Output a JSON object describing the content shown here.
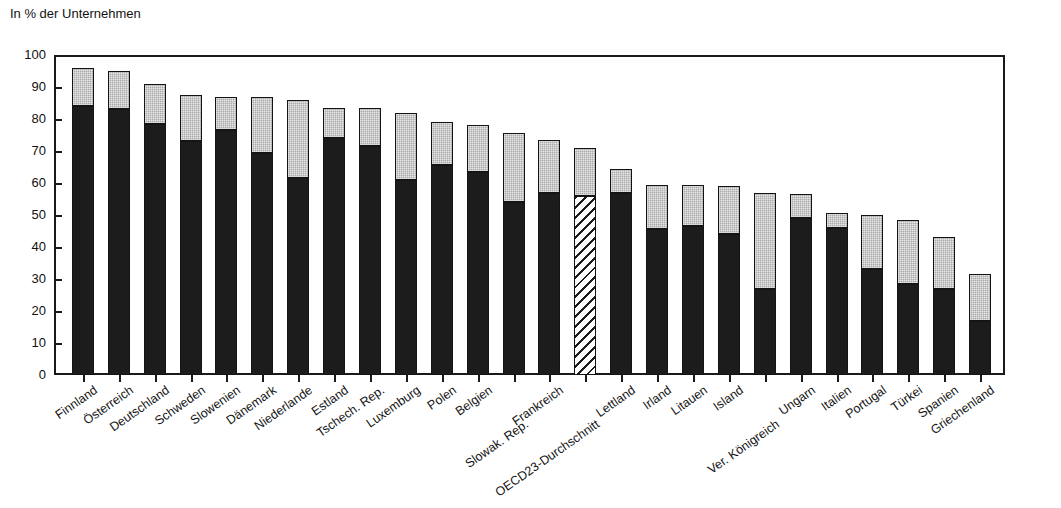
{
  "chart_data": {
    "type": "bar",
    "subtype": "stacked-bar",
    "title": "",
    "ylabel": "In % der Unternehmen",
    "xlabel": "",
    "ylim": [
      0,
      100
    ],
    "yticks": [
      0,
      10,
      20,
      30,
      40,
      50,
      60,
      70,
      80,
      90,
      100
    ],
    "grid": false,
    "legend_position": "none",
    "stacked": true,
    "categories": [
      "Finnland",
      "Österreich",
      "Deutschland",
      "Schweden",
      "Slowenien",
      "Dänemark",
      "Niederlande",
      "Estland",
      "Tschech. Rep.",
      "Luxemburg",
      "Polen",
      "Belgien",
      "Slowak. Rep.",
      "Frankreich",
      "OECD23-Durchschnitt",
      "Lettland",
      "Irland",
      "Litauen",
      "Island",
      "Ver. Königreich",
      "Ungarn",
      "Italien",
      "Portugal",
      "Türkei",
      "Spanien",
      "Griechenland"
    ],
    "series": [
      {
        "name": "lower-segment",
        "color": "#1c1c1c",
        "values": [
          84,
          83,
          78.5,
          73,
          76.5,
          69.5,
          61.5,
          74,
          71.5,
          61,
          65.5,
          63.5,
          54,
          57,
          56,
          57,
          45.5,
          46.5,
          44,
          27,
          49,
          46,
          33,
          28.5,
          27,
          17
        ]
      },
      {
        "name": "upper-segment",
        "color": "#a9a9a9",
        "values": [
          12,
          12,
          12.5,
          14.5,
          10.5,
          17.5,
          24.5,
          9.5,
          12,
          21,
          13.5,
          14.5,
          21.5,
          16.5,
          15,
          7.5,
          14,
          13,
          15,
          30,
          7.5,
          4.5,
          17,
          20,
          16,
          14.5
        ]
      }
    ],
    "totals": [
      96,
      95,
      91,
      87.5,
      87,
      87,
      86,
      83.5,
      83.5,
      82,
      79,
      78,
      75.5,
      73.5,
      71,
      64.5,
      59.5,
      59.5,
      59,
      57,
      56.5,
      50.5,
      50,
      48.5,
      43,
      31.5
    ],
    "highlighted_category": "OECD23-Durchschnitt",
    "highlight_style": "diagonal-hatch"
  },
  "axis": {
    "y_title": "In % der Unternehmen",
    "y_tick_labels": [
      "100",
      "90",
      "80",
      "70",
      "60",
      "50",
      "40",
      "30",
      "20",
      "10",
      "0"
    ]
  }
}
